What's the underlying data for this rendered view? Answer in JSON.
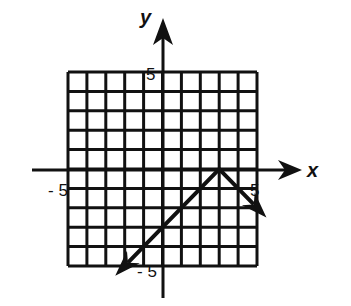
{
  "chart_data": {
    "type": "line",
    "title": "",
    "xlabel": "x",
    "ylabel": "y",
    "xlim": [
      -5,
      5
    ],
    "ylim": [
      -5,
      5
    ],
    "grid": true,
    "tick_labels": {
      "x_min": "- 5",
      "x_max": "5",
      "y_max": "5",
      "y_min": "- 5"
    },
    "series": [
      {
        "name": "y = -|x - 3|",
        "x": [
          -2.5,
          3,
          5.5
        ],
        "y": [
          -5.5,
          0,
          -2.5
        ],
        "vertex": [
          3,
          0
        ],
        "arrows_at_ends": true
      }
    ]
  },
  "labels": {
    "x_axis": "x",
    "y_axis": "y",
    "x_min": "- 5",
    "x_max": "5",
    "y_max": "5",
    "y_min": "- 5"
  }
}
